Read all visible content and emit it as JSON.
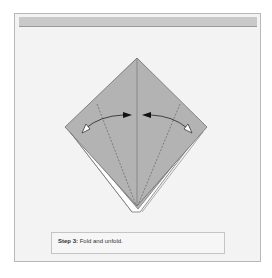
{
  "figure": {
    "step_label": "Step 3:",
    "instruction": "Fold and unfold.",
    "paper_color": "#b5b5b5",
    "background_color": "#f3f3f3",
    "header_bar_color": "#c9c9c9"
  }
}
